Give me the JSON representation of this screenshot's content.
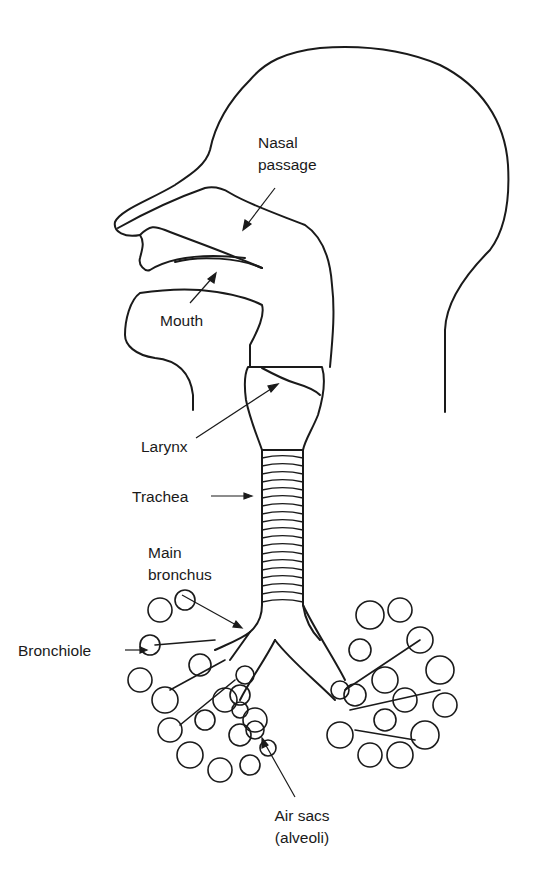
{
  "diagram": {
    "labels": {
      "nasal_passage_line1": "Nasal",
      "nasal_passage_line2": "passage",
      "mouth": "Mouth",
      "larynx": "Larynx",
      "trachea": "Trachea",
      "main_bronchus_line1": "Main",
      "main_bronchus_line2": "bronchus",
      "bronchiole": "Bronchiole",
      "air_sacs_line1": "Air sacs",
      "air_sacs_line2": "(alveoli)"
    },
    "colors": {
      "ink": "#1a1a1a",
      "background": "#ffffff"
    }
  }
}
